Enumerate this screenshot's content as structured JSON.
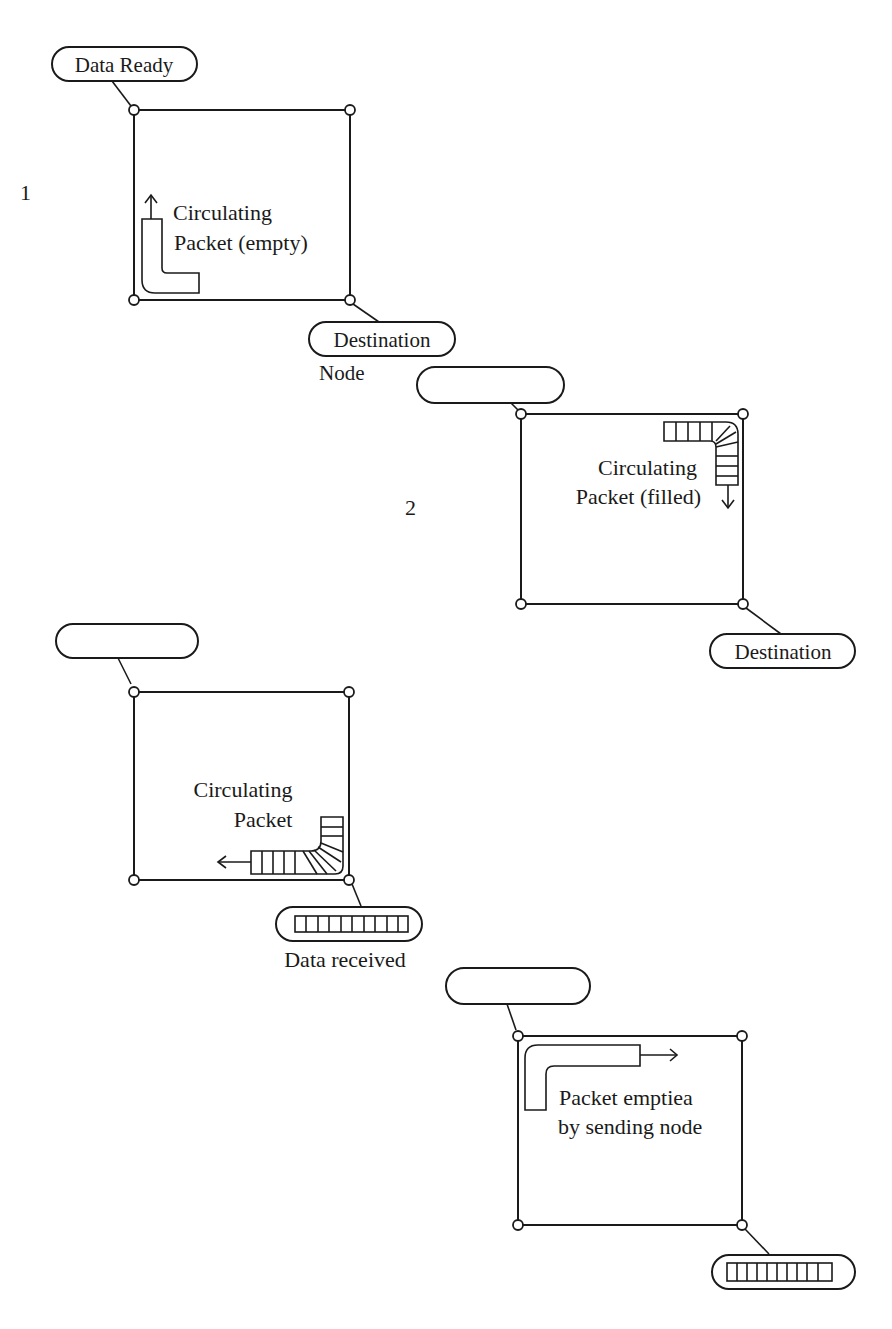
{
  "diagram": {
    "stroke_color": "#1a1a1a",
    "background": "#ffffff",
    "stages": [
      {
        "number": "1",
        "top_tag": "Data Ready",
        "bottom_tag": "Destination",
        "bottom_tag_sub": "Node",
        "packet_label_line1": "Circulating",
        "packet_label_line2": "Packet (empty)",
        "packet_state": "empty",
        "arrow_direction": "up"
      },
      {
        "number": "2",
        "top_tag": "",
        "bottom_tag": "Destination",
        "packet_label_line1": "Circulating",
        "packet_label_line2": "Packet (filled)",
        "packet_state": "filled",
        "arrow_direction": "down"
      },
      {
        "number": "",
        "top_tag": "",
        "bottom_tag": "",
        "bottom_caption": "Data received",
        "packet_label_line1": "Circulating",
        "packet_label_line2": "Packet",
        "packet_state": "filled",
        "arrow_direction": "left",
        "bottom_tag_contains_data": true
      },
      {
        "number": "",
        "top_tag": "",
        "bottom_tag": "",
        "packet_label_line1": "Packet emptiea",
        "packet_label_line2": "by sending node",
        "packet_state": "empty",
        "arrow_direction": "right",
        "bottom_tag_contains_data": true
      }
    ]
  }
}
